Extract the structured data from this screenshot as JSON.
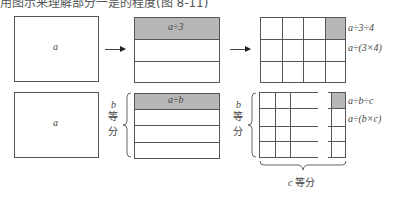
{
  "caption_fragment": "用图示来理解部分一是的程度(图 8-11)",
  "top_row": {
    "box1": {
      "label": "a"
    },
    "box2": {
      "label": "a÷3",
      "rows": 3
    },
    "box3": {
      "rows": 3,
      "cols": 4,
      "labels": [
        "a÷3÷4",
        "a÷(3×4)"
      ]
    }
  },
  "bottom_row": {
    "box4": {
      "label": "a"
    },
    "box5": {
      "label": "a÷b",
      "rows": 4,
      "brace_label_var": "b",
      "brace_label_text": [
        "等",
        "分"
      ]
    },
    "box6": {
      "labels": [
        "a÷b÷c",
        "a÷(b×c)"
      ],
      "brace_label_var": "b",
      "brace_label_text": [
        "等",
        "分"
      ],
      "bottom_brace_var": "c",
      "bottom_brace_text": "等分"
    }
  },
  "colors": {
    "shade": "#b7b7b7",
    "line": "#555555"
  }
}
